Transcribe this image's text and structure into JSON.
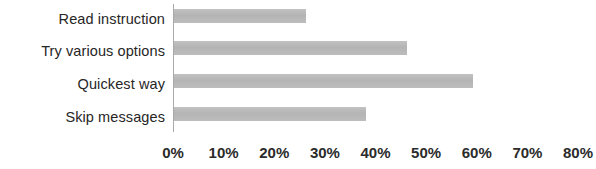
{
  "chart_data": {
    "type": "bar",
    "orientation": "horizontal",
    "title": "",
    "xlabel": "",
    "ylabel": "",
    "categories": [
      "Read instruction",
      "Try various options",
      "Quickest way",
      "Skip messages"
    ],
    "values": [
      26,
      46,
      59,
      38
    ],
    "value_suffix": "%",
    "xlim": [
      0,
      80
    ],
    "xticks": [
      0,
      10,
      20,
      30,
      40,
      50,
      60,
      70,
      80
    ],
    "xtick_labels": [
      "0%",
      "10%",
      "20%",
      "30%",
      "40%",
      "50%",
      "60%",
      "70%",
      "80%"
    ],
    "grid": false,
    "legend": false,
    "series": [
      {
        "name": "",
        "values": [
          26,
          46,
          59,
          38
        ]
      }
    ]
  },
  "style": {
    "bar_color": "#b9b9b9",
    "axis_color": "#a9a9a9",
    "text_color": "#2b2b2b",
    "background_color": "#ffffff"
  }
}
